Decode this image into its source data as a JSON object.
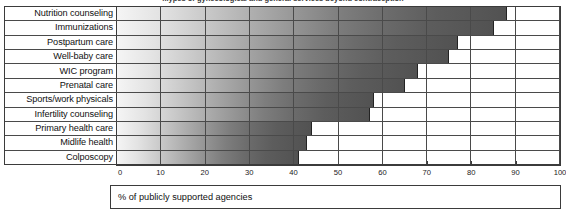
{
  "chart_data": {
    "type": "bar",
    "orientation": "horizontal",
    "title": "...ypes of gynecological and general services beyond contraception",
    "xlabel": "% of publicly supported agencies",
    "ylabel": "",
    "xlim": [
      0,
      100
    ],
    "xticks": [
      0,
      10,
      20,
      30,
      40,
      50,
      60,
      70,
      80,
      90,
      100
    ],
    "xtick_labels": [
      "0",
      "10",
      "20",
      "30",
      "40",
      "50",
      "60",
      "70",
      "80",
      "90",
      "100"
    ],
    "grid": true,
    "legend": "none",
    "categories": [
      "Nutrition counseling",
      "Immunizations",
      "Postpartum care",
      "Well-baby care",
      "WIC program",
      "Prenatal care",
      "Sports/work physicals",
      "Infertility counseling",
      "Primary health care",
      "Midlife health",
      "Colposcopy"
    ],
    "values": [
      88,
      85,
      77,
      75,
      68,
      65,
      58,
      57,
      44,
      43,
      41
    ]
  },
  "colors": {
    "frame": "#3b3b3b",
    "gridline": "#4a4a4a",
    "bar_light": "#f5f5f5",
    "bar_dark": "#525252",
    "background": "#ffffff",
    "text": "#111111"
  }
}
